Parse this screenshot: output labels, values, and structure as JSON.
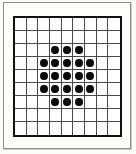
{
  "figure": {
    "name": "dot-grid-diagram",
    "background_color": "#fbfbf9",
    "page_border_color": "#8e8e8e",
    "grid_border_color": "#111111",
    "grid_line_color": "#4a4a4a",
    "dot_color": "#0b0b0b",
    "cell_fill_color": "#ffffff"
  },
  "grid": {
    "columns": 9,
    "rows": 9,
    "total_cells": 81,
    "filled_count": 21,
    "empty_count": 60
  },
  "chart_data": {
    "type": "heatmap",
    "title": "",
    "xlabel": "",
    "ylabel": "",
    "columns": 9,
    "rows": 9,
    "legend": [],
    "annotations": [],
    "grid": true,
    "value_meaning": {
      "1": "filled dot",
      "0": "empty cell"
    },
    "cells": [
      [
        0,
        0,
        0,
        0,
        0,
        0,
        0,
        0,
        0
      ],
      [
        0,
        0,
        0,
        0,
        0,
        0,
        0,
        0,
        0
      ],
      [
        0,
        0,
        0,
        1,
        1,
        1,
        0,
        0,
        0
      ],
      [
        0,
        0,
        1,
        1,
        1,
        1,
        1,
        0,
        0
      ],
      [
        0,
        0,
        1,
        1,
        1,
        1,
        1,
        0,
        0
      ],
      [
        0,
        0,
        1,
        1,
        1,
        1,
        1,
        0,
        0
      ],
      [
        0,
        0,
        0,
        1,
        1,
        1,
        0,
        0,
        0
      ],
      [
        0,
        0,
        0,
        0,
        0,
        0,
        0,
        0,
        0
      ],
      [
        0,
        0,
        0,
        0,
        0,
        0,
        0,
        0,
        0
      ]
    ],
    "row_filled_counts": [
      0,
      0,
      3,
      5,
      5,
      5,
      3,
      0,
      0
    ],
    "column_filled_counts": [
      0,
      0,
      3,
      5,
      5,
      5,
      3,
      0,
      0
    ]
  }
}
